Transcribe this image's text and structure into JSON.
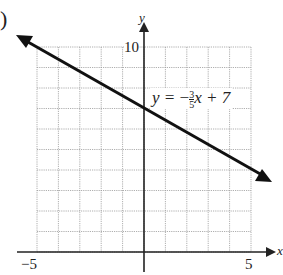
{
  "problem_label": ")",
  "chart_data": {
    "type": "line",
    "title": "",
    "equation": "y = -3/5 x + 7",
    "equation_display": {
      "lhs": "y =",
      "sign": "−",
      "num": "3",
      "den": "5",
      "rest": "x + 7"
    },
    "series": [
      {
        "name": "y = -3/5 x + 7",
        "slope": -0.6,
        "intercept": 7,
        "x": [
          -5.8,
          6.0
        ],
        "y": [
          10.48,
          3.4
        ]
      }
    ],
    "xlabel": "x",
    "ylabel": "y",
    "xlim": [
      -5,
      5
    ],
    "ylim": [
      0,
      10
    ],
    "x_ticks_labeled": [
      "-5",
      "5"
    ],
    "y_ticks_labeled": [
      "10"
    ],
    "grid": true,
    "grid_step": 1
  },
  "labels": {
    "x_min": "−5",
    "x_max": "5",
    "y_max": "10",
    "x_axis": "x",
    "y_axis": "y"
  }
}
